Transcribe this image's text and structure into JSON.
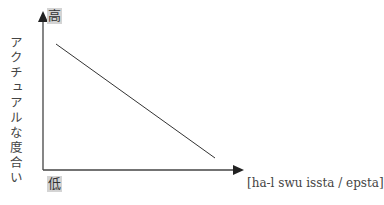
{
  "diagram": {
    "y_axis": {
      "label": "アクチュアルな度合い",
      "top_label": "高",
      "bottom_label": "低"
    },
    "x_axis": {
      "label": "[ha-l swu issta / epsta]"
    },
    "line": {
      "description": "negative linear relationship",
      "start": "high",
      "end": "low"
    },
    "colors": {
      "axis": "#444444",
      "line": "#333333",
      "tag_background": "#d4d4d4"
    }
  }
}
